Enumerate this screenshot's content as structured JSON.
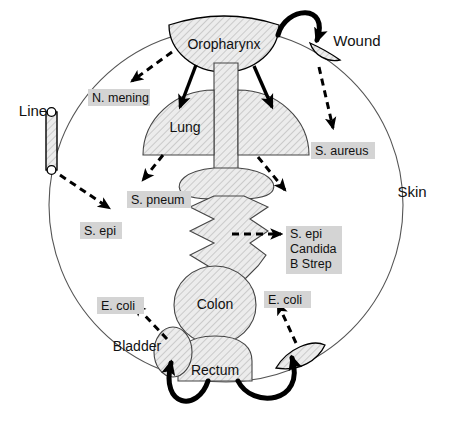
{
  "figure": {
    "title_visible": false,
    "background_color": "#ffffff",
    "organ_fill": "#e9e9e9",
    "label_highlight_color": "#d4d4d4",
    "outline_color": "#555555"
  },
  "body_outline": {
    "name": "Skin",
    "label": "Skin",
    "label_x": 412,
    "label_y": 193
  },
  "organs": [
    {
      "id": "oropharynx",
      "label": "Oropharynx",
      "x": 224,
      "y": 45
    },
    {
      "id": "lung",
      "label": "Lung",
      "x": 185,
      "y": 128
    },
    {
      "id": "colon",
      "label": "Colon",
      "x": 215,
      "y": 305
    },
    {
      "id": "rectum",
      "label": "Rectum",
      "x": 215,
      "y": 371
    },
    {
      "id": "bladder",
      "label": "Bladder",
      "x": 137,
      "y": 347
    },
    {
      "id": "wound",
      "label": "Wound",
      "x": 357,
      "y": 42
    },
    {
      "id": "line",
      "label": "Line",
      "x": 33,
      "y": 112
    }
  ],
  "pathogen_labels": [
    {
      "id": "n-mening",
      "lines": [
        "N. mening"
      ],
      "x": 88,
      "y": 89,
      "width": 62,
      "height": 17
    },
    {
      "id": "s-aureus",
      "lines": [
        "S. aureus"
      ],
      "x": 311,
      "y": 142,
      "width": 64,
      "height": 17
    },
    {
      "id": "s-pneum",
      "lines": [
        "S. pneum"
      ],
      "x": 127,
      "y": 191,
      "width": 64,
      "height": 17
    },
    {
      "id": "s-epi-line",
      "lines": [
        "S. epi"
      ],
      "x": 80,
      "y": 222,
      "width": 42,
      "height": 17
    },
    {
      "id": "s-epi-candida-bstrep",
      "lines": [
        "S. epi",
        "Candida",
        "B Strep"
      ],
      "x": 286,
      "y": 226,
      "width": 56,
      "height": 48
    },
    {
      "id": "e-coli-bladder",
      "lines": [
        "E. coli"
      ],
      "x": 97,
      "y": 297,
      "width": 47,
      "height": 17
    },
    {
      "id": "e-coli-perineum",
      "lines": [
        "E. coli"
      ],
      "x": 264,
      "y": 291,
      "width": 47,
      "height": 17
    }
  ],
  "transmission_routes": [
    {
      "from": "oropharynx",
      "to": "n-mening",
      "style": "dashed"
    },
    {
      "from": "oropharynx",
      "to": "lung-left",
      "style": "solid"
    },
    {
      "from": "oropharynx",
      "to": "lung-right",
      "style": "solid"
    },
    {
      "from": "oropharynx",
      "to": "wound",
      "style": "thick-curve"
    },
    {
      "from": "wound",
      "to": "s-aureus",
      "style": "dashed"
    },
    {
      "from": "lung-left",
      "to": "s-pneum",
      "style": "dashed"
    },
    {
      "from": "lung-right",
      "to": "skin-right",
      "style": "dashed"
    },
    {
      "from": "line",
      "to": "s-epi-line",
      "style": "dashed"
    },
    {
      "from": "gi-tract",
      "to": "s-epi-candida-bstrep",
      "style": "dashed"
    },
    {
      "from": "bladder",
      "to": "e-coli-bladder",
      "style": "dashed"
    },
    {
      "from": "rectum",
      "to": "bladder",
      "style": "thick-curve"
    },
    {
      "from": "rectum",
      "to": "perineum",
      "style": "thick-curve"
    },
    {
      "from": "perineum",
      "to": "e-coli-perineum",
      "style": "dashed"
    }
  ]
}
